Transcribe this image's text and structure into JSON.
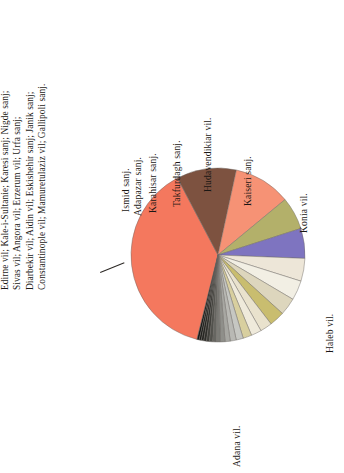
{
  "figure": {
    "orientation": "rotated-90-ccw",
    "background": "#ffffff"
  },
  "caption": {
    "lines": [
      "Edirne vil; Kale-i-Sultanie; Karesi sanj; Nigde sanj;",
      "Sivas vil; Angora vil; Erzerum vil; Urfa sanj;",
      "Diarbekir vil; Aidin vil; Eskishehir sanj; Janik sanj;",
      "Constantinople vil; Mamuretulaziz vil;  Gallipoli sanj."
    ]
  },
  "chart_data": {
    "type": "pie",
    "title": "",
    "xlabel": "",
    "ylabel": "",
    "legend_position": "slice-labels",
    "grid": false,
    "categories": [
      "Adana vil.",
      "Haleb vil.",
      "Konia vil.",
      "Kaiseri sanj.",
      "Hudavendikiar vil.",
      "Takfurdagh sanj.",
      "Karahisar sanj.",
      "Adapazar sanj.",
      "Ismid sanj.",
      "Edirne vil.",
      "Kale-i-Sultanie",
      "Karesi sanj.",
      "Nigde sanj.",
      "Sivas vil.",
      "Angora vil.",
      "Erzerum vil.",
      "Urfa sanj.",
      "Diarbekir vil.",
      "Aidin vil.",
      "Eskishehir sanj.",
      "Janik sanj.",
      "Constantinople vil.",
      "Mamuretulaziz vil.",
      "Gallipoli sanj."
    ],
    "values": [
      38.0,
      11.0,
      10.5,
      6.0,
      5.5,
      4.2,
      3.6,
      3.2,
      2.8,
      2.2,
      1.9,
      1.6,
      1.3,
      1.1,
      0.95,
      0.85,
      0.75,
      0.65,
      0.6,
      0.55,
      0.5,
      0.45,
      0.4,
      0.38
    ],
    "colors": [
      "#f4785e",
      "#7d5240",
      "#f69275",
      "#b3b06a",
      "#7e74c0",
      "#ede6d8",
      "#f2efe4",
      "#ddd6bd",
      "#c9bd6f",
      "#e9e2cd",
      "#efeadb",
      "#d8cf9f",
      "#c6c7c2",
      "#b9b9b4",
      "#a7a7a2",
      "#8f8f8a",
      "#7a7a75",
      "#666661",
      "#52524d",
      "#3f3f3a",
      "#2e2e2a",
      "#252521",
      "#1d1d1a",
      "#141412"
    ],
    "labeled_slices": [
      "Ismid sanj.",
      "Adapazar sanj.",
      "Karahisar sanj.",
      "Takfurdagh sanj.",
      "Hudavendikiar vil.",
      "Kaiseri sanj.",
      "Konia vil.",
      "Haleb vil.",
      "Adana vil."
    ]
  },
  "labels": {
    "ismid": "Ismid sanj.",
    "adapazar": "Adapazar sanj.",
    "karahisar": "Karahisar sanj.",
    "takfurdagh": "Takfurdagh sanj.",
    "hudavendikiar": "Hudavendikiar vil.",
    "kaiseri": "Kaiseri sanj.",
    "konia": "Konia vil.",
    "haleb": "Haleb vil.",
    "adana": "Adana vil."
  }
}
